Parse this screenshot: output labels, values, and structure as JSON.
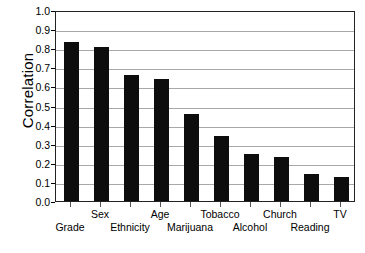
{
  "chart_data": {
    "type": "bar",
    "title": "",
    "subtitle": "",
    "xlabel": "",
    "ylabel": "Correlation",
    "categories": [
      "Grade",
      "Sex",
      "Ethnicity",
      "Age",
      "Marijuana",
      "Tobacco",
      "Alcohol",
      "Church",
      "Reading",
      "TV"
    ],
    "values": [
      0.835,
      0.805,
      0.658,
      0.637,
      0.457,
      0.338,
      0.248,
      0.233,
      0.142,
      0.126
    ],
    "ylim": [
      0.0,
      1.0
    ],
    "ytick_labels": [
      "1.0",
      "0.9",
      "0.8",
      "0.7",
      "0.6",
      "0.5",
      "0.4",
      "0.3",
      "0.2",
      "0.1",
      "0.0"
    ],
    "ytick_values": [
      1.0,
      0.9,
      0.8,
      0.7,
      0.6,
      0.5,
      0.4,
      0.3,
      0.2,
      0.1,
      0.0
    ],
    "grid": "horizontal",
    "legend": "none",
    "bar_color": "#0d0d0d",
    "grid_color": "#a8a8a8",
    "axis_color": "#222222",
    "background_color": "#ffffff",
    "label_rows": [
      1,
      0,
      1,
      0,
      1,
      0,
      1,
      0,
      1,
      0
    ]
  }
}
